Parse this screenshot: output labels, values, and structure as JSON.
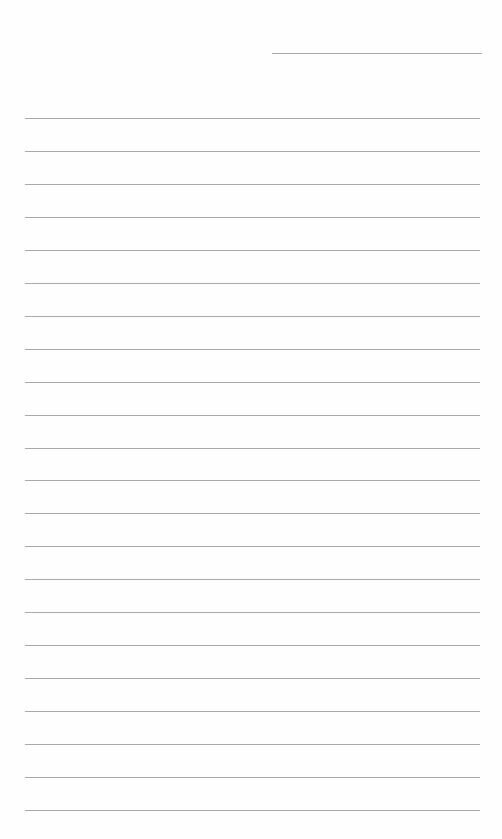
{
  "document": {
    "type": "blank lined sheet",
    "header_line": {
      "x": 272,
      "y": 53,
      "width": 210
    },
    "ruled_lines": {
      "count": 22,
      "start_y": 118,
      "spacing": 32.95,
      "x": 25,
      "width": 455
    },
    "line_color": "#9a9a9a",
    "background": "#fefefe"
  }
}
